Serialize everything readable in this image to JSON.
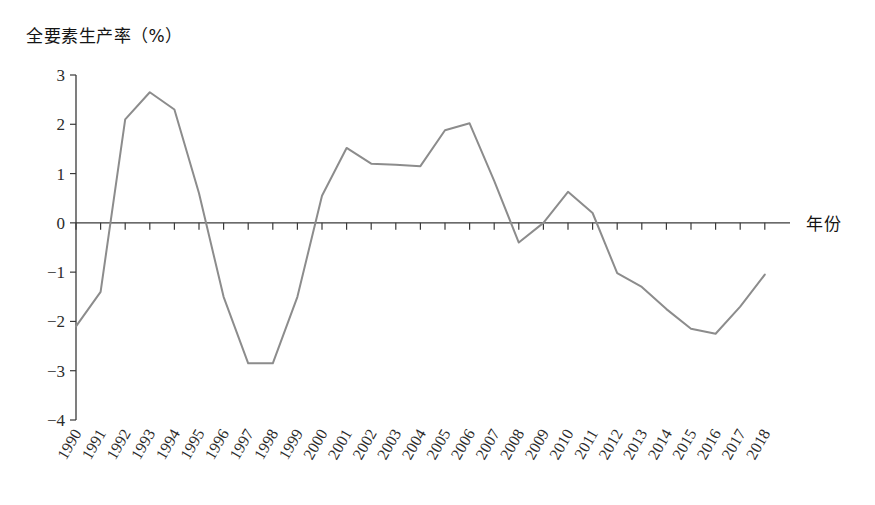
{
  "chart_data": {
    "type": "line",
    "title": "",
    "ylabel": "全要素生产率（%）",
    "xlabel": "年份",
    "ylim": [
      -4,
      3
    ],
    "yticks": [
      3,
      2,
      1,
      0,
      -1,
      -2,
      -3,
      -4
    ],
    "ytick_labels": [
      "3",
      "2",
      "1",
      "0",
      "−1",
      "−2",
      "−3",
      "−4"
    ],
    "grid": false,
    "legend": "none",
    "line_color": "#8c8c8c",
    "axis_color": "#3a3a3a",
    "categories": [
      "1990",
      "1991",
      "1992",
      "1993",
      "1994",
      "1995",
      "1996",
      "1997",
      "1998",
      "1999",
      "2000",
      "2001",
      "2002",
      "2003",
      "2004",
      "2005",
      "2006",
      "2007",
      "2008",
      "2009",
      "2010",
      "2011",
      "2012",
      "2013",
      "2014",
      "2015",
      "2016",
      "2017",
      "2018"
    ],
    "series": [
      {
        "name": "全要素生产率",
        "values": [
          -2.1,
          -1.4,
          2.1,
          2.65,
          2.3,
          0.6,
          -1.5,
          -2.85,
          -2.85,
          -1.5,
          0.55,
          1.52,
          1.2,
          1.18,
          1.15,
          1.88,
          2.02,
          0.85,
          -0.4,
          0.0,
          0.63,
          0.2,
          -1.02,
          -1.3,
          -1.75,
          -2.15,
          -2.25,
          -1.7,
          -1.05
        ]
      }
    ]
  },
  "labels": {
    "y_axis_title": "全要素生产率（%）",
    "x_axis_title": "年份"
  }
}
